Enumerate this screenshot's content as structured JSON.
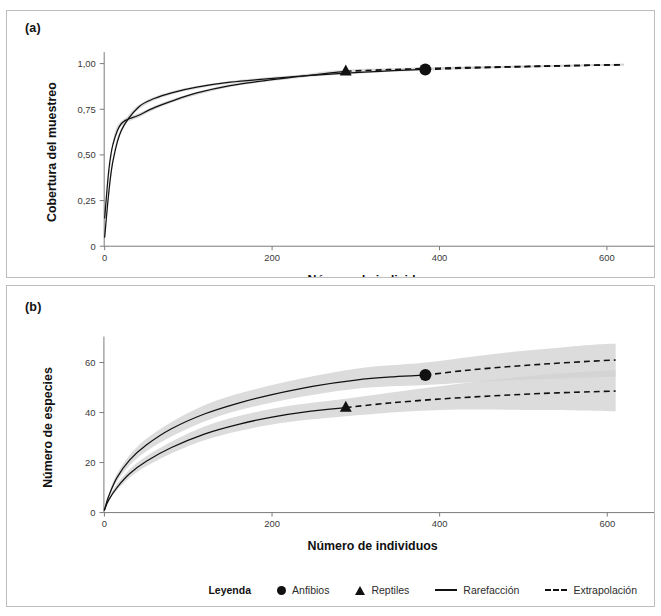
{
  "figure": {
    "panel_a_tag": "(a)",
    "panel_b_tag": "(b)"
  },
  "legend": {
    "title": "Leyenda",
    "items": [
      {
        "label": "Anfibios",
        "glyph": "circle-marker-icon"
      },
      {
        "label": "Reptiles",
        "glyph": "triangle-marker-icon"
      },
      {
        "label": "Rarefacción",
        "glyph": "solid-line-icon"
      },
      {
        "label": "Extrapolación",
        "glyph": "dashed-line-icon"
      }
    ]
  },
  "colors": {
    "line": "#111111",
    "band": "#d2d2d2",
    "band_overlap": "#b0b0b0",
    "axis": "#7a7a7a",
    "panel_border": "#bdbdbd"
  },
  "chart_data": [
    {
      "id": "panel-a",
      "type": "line",
      "title": "(a)",
      "xlabel": "Número de individuos",
      "ylabel": "Cobertura del muestreo",
      "xlim": [
        0,
        640
      ],
      "ylim": [
        0,
        1.03
      ],
      "xticks": [
        0,
        200,
        400,
        600
      ],
      "xticklabels": [
        "0",
        "200",
        "400",
        "600"
      ],
      "yticks": [
        0,
        0.25,
        0.5,
        0.75,
        1.0
      ],
      "yticklabels": [
        "0",
        "0,25",
        "0,50",
        "0,75",
        "1,00"
      ],
      "grid": false,
      "legend_position": "below-figure",
      "series": [
        {
          "name": "Anfibios",
          "marker": "circle",
          "reference_point": {
            "x": 383,
            "y": 0.968
          },
          "rarefaction": {
            "x": [
              0,
              5,
              10,
              20,
              40,
              60,
              80,
              110,
              150,
              190,
              230,
              270,
              310,
              345,
              383
            ],
            "y": [
              0.05,
              0.3,
              0.47,
              0.635,
              0.76,
              0.81,
              0.84,
              0.871,
              0.898,
              0.915,
              0.93,
              0.943,
              0.953,
              0.961,
              0.968
            ]
          },
          "extrapolation": {
            "x": [
              383,
              430,
              480,
              530,
              580,
              620
            ],
            "y": [
              0.968,
              0.975,
              0.981,
              0.986,
              0.991,
              0.994
            ]
          },
          "band_lower": {
            "x": [
              0,
              10,
              20,
              40,
              80,
              150,
              230,
              310,
              383,
              480,
              580,
              620
            ],
            "y": [
              0.04,
              0.455,
              0.62,
              0.748,
              0.831,
              0.891,
              0.923,
              0.947,
              0.962,
              0.976,
              0.986,
              0.989
            ]
          },
          "band_upper": {
            "x": [
              0,
              10,
              20,
              40,
              80,
              150,
              230,
              310,
              383,
              480,
              580,
              620
            ],
            "y": [
              0.06,
              0.485,
              0.65,
              0.772,
              0.849,
              0.905,
              0.937,
              0.959,
              0.975,
              0.987,
              0.996,
              0.999
            ]
          }
        },
        {
          "name": "Reptiles",
          "marker": "triangle",
          "reference_point": {
            "x": 288,
            "y": 0.958
          },
          "rarefaction": {
            "x": [
              0,
              5,
              10,
              20,
              40,
              60,
              80,
              110,
              150,
              190,
              230,
              260,
              288
            ],
            "y": [
              0.155,
              0.42,
              0.56,
              0.672,
              0.716,
              0.76,
              0.795,
              0.84,
              0.88,
              0.906,
              0.928,
              0.944,
              0.958
            ]
          },
          "extrapolation": {
            "x": [
              288,
              340,
              400,
              460,
              520,
              580,
              620
            ],
            "y": [
              0.958,
              0.967,
              0.975,
              0.981,
              0.986,
              0.991,
              0.994
            ]
          },
          "band_lower": {
            "x": [
              0,
              10,
              20,
              40,
              80,
              150,
              230,
              288,
              400,
              520,
              620
            ],
            "y": [
              0.145,
              0.545,
              0.658,
              0.704,
              0.786,
              0.872,
              0.92,
              0.95,
              0.969,
              0.981,
              0.989
            ]
          },
          "band_upper": {
            "x": [
              0,
              10,
              20,
              40,
              80,
              150,
              230,
              288,
              400,
              520,
              620
            ],
            "y": [
              0.165,
              0.575,
              0.686,
              0.728,
              0.804,
              0.888,
              0.936,
              0.966,
              0.981,
              0.991,
              0.999
            ]
          }
        }
      ]
    },
    {
      "id": "panel-b",
      "type": "line",
      "title": "(b)",
      "xlabel": "Número de individuos",
      "ylabel": "Número de especies",
      "xlim": [
        0,
        640
      ],
      "ylim": [
        0,
        68
      ],
      "xticks": [
        0,
        200,
        400,
        600
      ],
      "xticklabels": [
        "0",
        "200",
        "400",
        "600"
      ],
      "yticks": [
        0,
        20,
        40,
        60
      ],
      "yticklabels": [
        "0",
        "20",
        "40",
        "60"
      ],
      "grid": false,
      "legend_position": "below-panel",
      "series": [
        {
          "name": "Anfibios",
          "marker": "circle",
          "reference_point": {
            "x": 383,
            "y": 55.0
          },
          "rarefaction": {
            "x": [
              0,
              5,
              15,
              30,
              50,
              80,
              120,
              160,
              200,
              250,
              300,
              345,
              383
            ],
            "y": [
              1.0,
              6.5,
              14.0,
              21.0,
              27.0,
              33.5,
              39.5,
              43.8,
              47.2,
              50.6,
              53.0,
              54.3,
              55.0
            ]
          },
          "extrapolation": {
            "x": [
              383,
              430,
              480,
              530,
              580,
              610
            ],
            "y": [
              55.0,
              56.8,
              58.3,
              59.5,
              60.5,
              61.0
            ]
          },
          "band_lower": {
            "x": [
              0,
              15,
              50,
              120,
              200,
              300,
              383,
              480,
              580,
              610
            ],
            "y": [
              1.0,
              12.5,
              24.5,
              36.5,
              44.0,
              49.5,
              51.0,
              52.8,
              54.0,
              54.3
            ]
          },
          "band_upper": {
            "x": [
              0,
              15,
              50,
              120,
              200,
              300,
              383,
              480,
              580,
              610
            ],
            "y": [
              1.0,
              15.5,
              29.5,
              43.0,
              51.0,
              57.5,
              60.0,
              64.0,
              67.0,
              67.5
            ]
          }
        },
        {
          "name": "Reptiles",
          "marker": "triangle",
          "reference_point": {
            "x": 288,
            "y": 42.0
          },
          "rarefaction": {
            "x": [
              0,
              5,
              15,
              30,
              50,
              80,
              120,
              160,
              200,
              240,
              288
            ],
            "y": [
              1.0,
              5.0,
              10.0,
              15.5,
              20.5,
              26.0,
              31.5,
              35.3,
              38.2,
              40.3,
              42.0
            ]
          },
          "extrapolation": {
            "x": [
              288,
              340,
              400,
              460,
              520,
              580,
              610
            ],
            "y": [
              42.0,
              43.8,
              45.4,
              46.6,
              47.6,
              48.3,
              48.6
            ]
          },
          "band_lower": {
            "x": [
              0,
              15,
              50,
              120,
              200,
              288,
              400,
              520,
              610
            ],
            "y": [
              1.0,
              9.0,
              18.5,
              29.0,
              35.2,
              38.5,
              41.0,
              41.0,
              40.5
            ]
          },
          "band_upper": {
            "x": [
              0,
              15,
              50,
              120,
              200,
              288,
              400,
              520,
              610
            ],
            "y": [
              1.0,
              11.5,
              22.5,
              34.5,
              41.5,
              45.5,
              50.5,
              55.0,
              57.0
            ]
          }
        }
      ]
    }
  ]
}
